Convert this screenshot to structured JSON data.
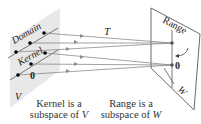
{
  "diagram": {
    "left_plane": {
      "domain_label": "Domain",
      "kernel_label": "Kernel",
      "space_label": "V",
      "zero_label": "0"
    },
    "right_plane": {
      "range_label": "Range",
      "space_label": "W",
      "zero_label": "0"
    },
    "map_label": "T",
    "captions": {
      "kernel": {
        "line1": "Kernel is a",
        "line2_prefix": "subspace of ",
        "line2_var": "V"
      },
      "range": {
        "line1": "Range is a",
        "line2_prefix": "subspace of ",
        "line2_var": "W"
      }
    },
    "colors": {
      "plane_fill": "#e6e6e6",
      "line": "#8a8a8a",
      "point": "#000000",
      "text": "#222222"
    }
  }
}
